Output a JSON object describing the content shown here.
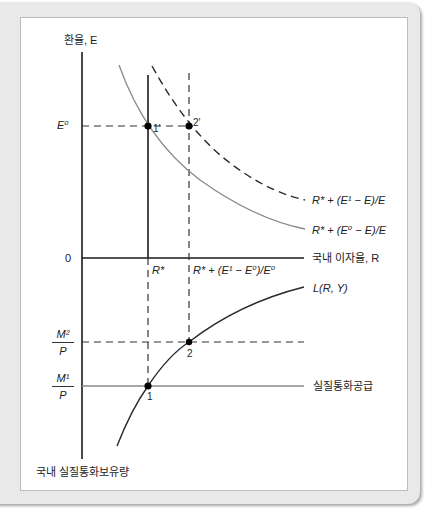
{
  "figure": {
    "y_axis_label_top": "환율, E",
    "y_axis_label_bottom": "국내 실질통화보유량",
    "x_axis_label": "국내 이자율, R",
    "origin_label": "0",
    "e0_label": "E⁰",
    "r_star_label": "R*",
    "r_new_label": "R* + (E¹ − E⁰)/E⁰",
    "curve_dashed_label": "R* + (E¹ − E)/E",
    "curve_solid_label": "R* + (E⁰ − E)/E",
    "money_demand_label": "L(R, Y)",
    "money_supply_label": "실질통화공급",
    "m2p_num": "M²",
    "m2p_den": "P",
    "m1p_num": "M¹",
    "m1p_den": "P",
    "points": {
      "p1prime": "1′",
      "p2prime": "2′",
      "p1": "1",
      "p2": "2"
    }
  },
  "colors": {
    "axis": "#1a1a1a",
    "solid_curve": "#8a8a8a",
    "dashed_curve": "#2a2a2a",
    "frame": "#e9e9e9",
    "panel_border": "#bdbdbd"
  }
}
